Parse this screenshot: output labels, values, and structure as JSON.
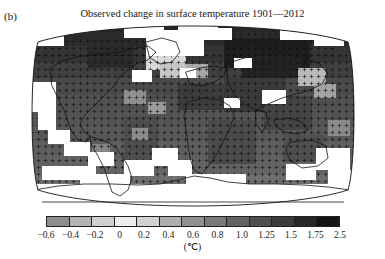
{
  "panel": {
    "label": "(b)"
  },
  "title": "Observed change in surface temperature 1901—2012",
  "colorbar": {
    "unit": "(℃)",
    "tick_labels": [
      "−0.6",
      "−0.4",
      "−0.2",
      "0",
      "0.2",
      "0.4",
      "0.6",
      "0.8",
      "1.0",
      "1.25",
      "1.5",
      "1.75",
      "2.5"
    ],
    "visible_tick_labels": [
      "−0.6",
      "−0.4",
      "−0.2",
      "0",
      "0.2",
      "0.4",
      "0.6",
      "0.8",
      "1.0",
      "1.25",
      "1.5",
      "1.75",
      "2.5"
    ],
    "segment_colors": [
      "#8d8d8d",
      "#b4b4b4",
      "#cfcfcf",
      "#ededed",
      "#d2d2d2",
      "#aeaeae",
      "#919191",
      "#7a7a7a",
      "#646464",
      "#4e4e4e",
      "#3a3a3a",
      "#262626",
      "#141414"
    ]
  },
  "chart_data": {
    "type": "heatmap",
    "title": "Observed change in surface temperature 1901—2012",
    "panel_label": "(b)",
    "xlabel": "",
    "ylabel": "",
    "zlabel": "(℃)",
    "projection": "Robinson",
    "grid": false,
    "legend_position": "bottom",
    "colorbar_orientation": "horizontal",
    "colorbar_scale": "discrete-nonlinear",
    "color_scheme": "grayscale",
    "boundaries": [
      -0.6,
      -0.4,
      -0.2,
      0,
      0.2,
      0.4,
      0.6,
      0.8,
      1.0,
      1.25,
      1.5,
      1.75,
      2.5
    ],
    "tick_labels": [
      "−0.6",
      "−0.4",
      "−0.2",
      "0",
      "0.2",
      "0.4",
      "0.6",
      "0.8",
      "1.0",
      "1.25",
      "1.5",
      "1.75",
      "2.5"
    ],
    "zlim": [
      -0.6,
      2.5
    ],
    "series": [
      {
        "name": "Observed surface temperature trend 1901–2012",
        "units": "℃ over period",
        "notes": "Stippled grid cells indicate trends significant at the 10% level; white cells indicate incomplete or missing data."
      }
    ],
    "annotations": [
      "Most land and ocean areas show warming between 0.2 and 2.5 ℃",
      "Strongest warming over northern high-latitude land (Arctic, Siberia, northern Canada)",
      "Small cooling areas (−0.6 to 0 ℃) over parts of the North Atlantic and southern oceans",
      "White regions over Antarctica and parts of the Southern Ocean denote missing data"
    ]
  }
}
